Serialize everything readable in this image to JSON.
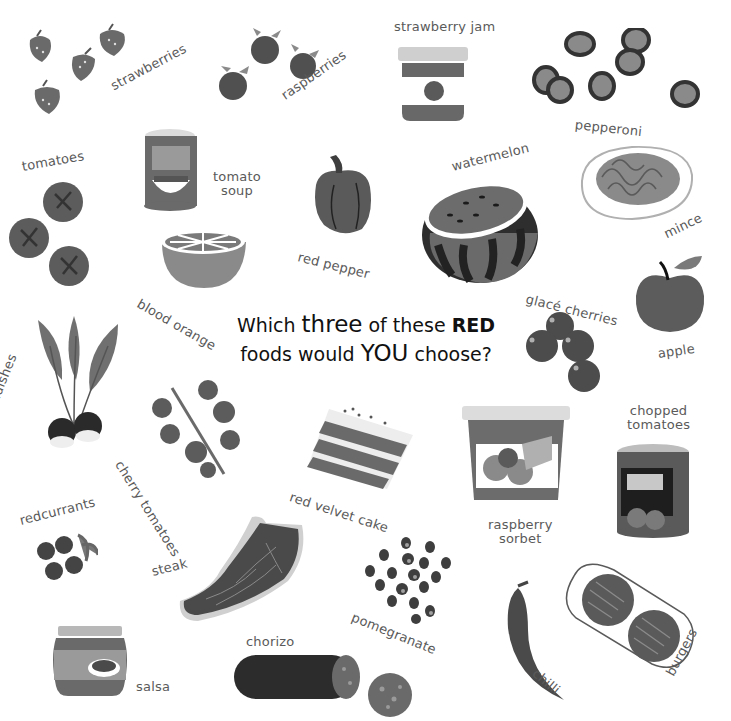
{
  "question": {
    "part1": "Which",
    "emph1": "three",
    "part2": "of these",
    "emph2": "RED",
    "part3": "foods would",
    "emph3": "YOU",
    "part4": "choose?"
  },
  "foods": {
    "strawberries": "strawberries",
    "raspberries": "raspberries",
    "strawberry_jam": "strawberry jam",
    "pepperoni": "pepperoni",
    "tomatoes": "tomatoes",
    "tomato_soup_1": "tomato",
    "tomato_soup_2": "soup",
    "red_pepper": "red pepper",
    "watermelon": "watermelon",
    "mince": "mince",
    "blood_orange": "blood orange",
    "glace_cherries": "glacé cherries",
    "apple": "apple",
    "radishes": "radishes",
    "cherry_tomatoes": "cherry tomatoes",
    "red_velvet_cake": "red velvet cake",
    "raspberry_sorbet_1": "raspberry",
    "raspberry_sorbet_2": "sorbet",
    "chopped_tomatoes_1": "chopped",
    "chopped_tomatoes_2": "tomatoes",
    "redcurrants": "redcurrants",
    "steak": "steak",
    "pomegranate": "pomegranate",
    "chilli": "chilli",
    "burgers": "burgers",
    "salsa": "salsa",
    "chorizo": "chorizo"
  },
  "colors": {
    "red_dark": "#4a4a4a",
    "red_mid": "#6e6e6e",
    "light": "#bdbdbd",
    "text": "#5a5a5a"
  }
}
